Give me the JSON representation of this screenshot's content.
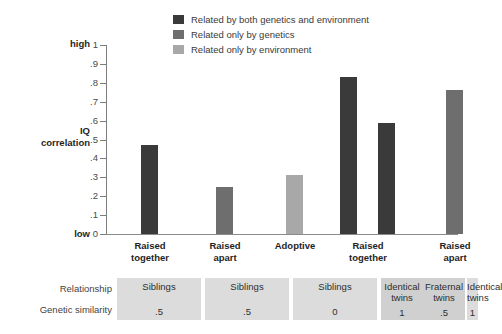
{
  "legend": {
    "items": [
      {
        "label": "Related by both genetics and environment",
        "color": "#3a3a3a",
        "swatch_name": "legend-swatch-both"
      },
      {
        "label": "Related only by genetics",
        "color": "#6e6e6e",
        "swatch_name": "legend-swatch-genetics"
      },
      {
        "label": "Related only by environment",
        "color": "#a8a8a8",
        "swatch_name": "legend-swatch-environment"
      }
    ]
  },
  "axis": {
    "high_label": "high",
    "low_label": "low",
    "title_line1": "IQ",
    "title_line2": "correlation",
    "ticks": [
      "1",
      ".9",
      ".8",
      ".7",
      ".6",
      ".5",
      ".4",
      ".3",
      ".2",
      ".1",
      "0"
    ]
  },
  "table": {
    "row_labels": [
      "Relationship",
      "Genetic similarity"
    ],
    "cells": [
      {
        "relationship": "Siblings",
        "genetic_similarity": ".5"
      },
      {
        "relationship": "Siblings",
        "genetic_similarity": ".5"
      },
      {
        "relationship": "Siblings",
        "genetic_similarity": "0"
      },
      {
        "relationship": "Identical twins",
        "genetic_similarity": "1"
      },
      {
        "relationship": "Fraternal twins",
        "genetic_similarity": ".5"
      },
      {
        "relationship": "Identical twins",
        "genetic_similarity": "1"
      }
    ]
  },
  "chart_data": {
    "type": "bar",
    "title": "",
    "xlabel": "",
    "ylabel": "IQ correlation",
    "ylim": [
      0,
      1
    ],
    "yticks": [
      0,
      0.1,
      0.2,
      0.3,
      0.4,
      0.5,
      0.6,
      0.7,
      0.8,
      0.9,
      1
    ],
    "grid": false,
    "legend_position": "top",
    "categories": [
      "Raised together",
      "Raised apart",
      "Adoptive",
      "Raised together",
      "Raised apart"
    ],
    "category_lines": [
      [
        "Raised",
        "together"
      ],
      [
        "Raised",
        "apart"
      ],
      [
        "Adoptive",
        ""
      ],
      [
        "Raised",
        "together"
      ],
      [
        "Raised",
        "apart"
      ]
    ],
    "bars": [
      {
        "category": "Raised together",
        "value": 0.47,
        "group": "Related by both genetics and environment",
        "color": "#3a3a3a",
        "relationship": "Siblings",
        "genetic_similarity": ".5"
      },
      {
        "category": "Raised apart",
        "value": 0.25,
        "group": "Related only by genetics",
        "color": "#6e6e6e",
        "relationship": "Siblings",
        "genetic_similarity": ".5"
      },
      {
        "category": "Adoptive",
        "value": 0.31,
        "group": "Related only by environment",
        "color": "#a8a8a8",
        "relationship": "Siblings",
        "genetic_similarity": "0"
      },
      {
        "category": "Raised together (identical twins)",
        "value": 0.83,
        "group": "Related by both genetics and environment",
        "color": "#3a3a3a",
        "relationship": "Identical twins",
        "genetic_similarity": "1"
      },
      {
        "category": "Raised together (fraternal twins)",
        "value": 0.585,
        "group": "Related by both genetics and environment",
        "color": "#3a3a3a",
        "relationship": "Fraternal twins",
        "genetic_similarity": ".5"
      },
      {
        "category": "Raised apart (identical twins)",
        "value": 0.76,
        "group": "Related only by genetics",
        "color": "#6e6e6e",
        "relationship": "Identical twins",
        "genetic_similarity": "1"
      }
    ]
  }
}
